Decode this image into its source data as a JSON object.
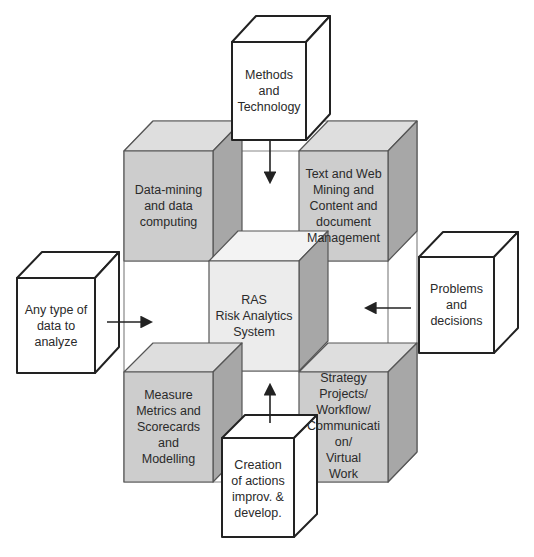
{
  "diagram": {
    "center": {
      "label": "RAS\nRisk Analytics\nSystem"
    },
    "core_blocks": [
      {
        "id": "top-left",
        "label": "Data-mining\nand data\ncomputing"
      },
      {
        "id": "top-right",
        "label": "Text and Web\nMining and\nContent and\ndocument\nManagement"
      },
      {
        "id": "bottom-left",
        "label": "Measure\nMetrics and\nScorecards\nand\nModelling"
      },
      {
        "id": "bottom-right",
        "label": "Strategy\nProjects/\nWorkflow/\nCommunicati\non/\nVirtual\nWork"
      }
    ],
    "inputs": [
      {
        "id": "top",
        "label": "Methods\nand\nTechnology",
        "arrow": "down"
      },
      {
        "id": "left",
        "label": "Any type of\ndata to\nanalyze",
        "arrow": "right"
      },
      {
        "id": "right",
        "label": "Problems\nand\ndecisions",
        "arrow": "left"
      },
      {
        "id": "bottom",
        "label": "Creation\nof actions\nimprov. &\ndevelop.",
        "arrow": "up"
      }
    ],
    "colors": {
      "front": "#cdcdcd",
      "top": "#dedede",
      "side": "#a7a7a7",
      "center_front": "#ececec",
      "center_top": "#f3f3f3",
      "line": "#333333"
    }
  }
}
